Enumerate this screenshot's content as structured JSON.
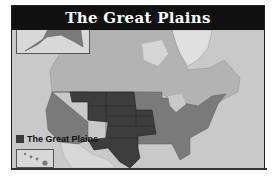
{
  "map": {
    "title": "The Great Plains",
    "legend": {
      "label": "The Great Plains",
      "swatch_color": "#3d3d3d"
    },
    "colors": {
      "ocean": "#c9c9c9",
      "land_other": "#d8d8d8",
      "canada": "#b3b3b3",
      "us_other": "#7a7a7a",
      "great_plains": "#3d3d3d",
      "title_bar": "#111111"
    },
    "highlighted_region_states": [
      "Montana",
      "Wyoming",
      "North Dakota",
      "South Dakota",
      "Nebraska",
      "Kansas",
      "Iowa",
      "Missouri",
      "Oklahoma",
      "Texas"
    ],
    "insets": [
      "Alaska",
      "Hawaii"
    ]
  }
}
